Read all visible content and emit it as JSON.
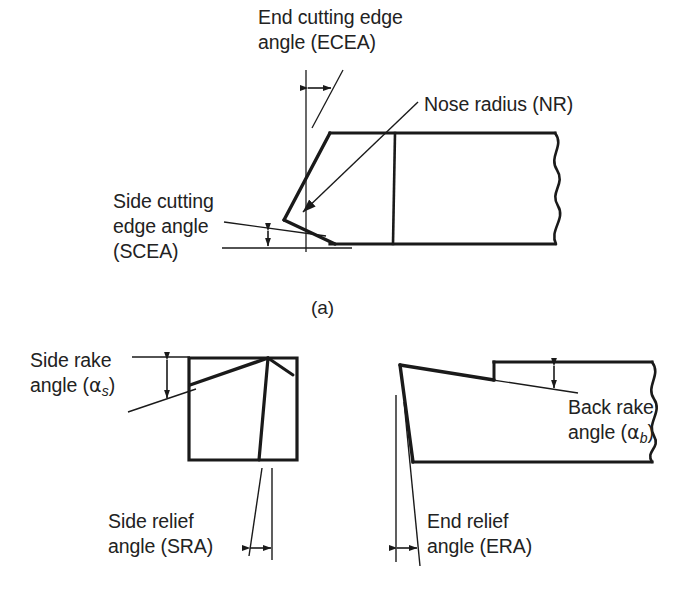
{
  "figure": {
    "background_color": "#ffffff",
    "line_color": "#1a1a1a",
    "text_color": "#222222",
    "width": 676,
    "height": 614
  },
  "view_a": {
    "caption": "(a)",
    "labels": {
      "ecea_line1": "End cutting edge",
      "ecea_line2": "angle (ECEA)",
      "nose_radius": "Nose radius (NR)",
      "scea_line1": "Side cutting",
      "scea_line2": "edge angle",
      "scea_line3": "(SCEA)"
    },
    "annotations": [
      {
        "name": "end-cutting-edge-angle",
        "abbr": "ECEA",
        "indicator": "horizontal-double-arrow"
      },
      {
        "name": "nose-radius",
        "abbr": "NR",
        "indicator": "leader-arrow"
      },
      {
        "name": "side-cutting-edge-angle",
        "abbr": "SCEA",
        "indicator": "vertical-double-arrow"
      }
    ]
  },
  "view_b_left": {
    "labels": {
      "side_rake_line1": "Side rake",
      "side_rake_line2_pre": "angle (",
      "side_rake_symbol": "α",
      "side_rake_subscript": "s",
      "side_rake_line2_post": ")",
      "side_relief_line1": "Side relief",
      "side_relief_line2": "angle (SRA)"
    },
    "annotations": [
      {
        "name": "side-rake-angle",
        "abbr": "αs",
        "indicator": "vertical-double-arrow"
      },
      {
        "name": "side-relief-angle",
        "abbr": "SRA",
        "indicator": "horizontal-double-arrow"
      }
    ]
  },
  "view_b_right": {
    "labels": {
      "back_rake_line1": "Back rake",
      "back_rake_line2_pre": "angle (",
      "back_rake_symbol": "α",
      "back_rake_subscript": "b",
      "back_rake_line2_post": ")",
      "end_relief_line1": "End relief",
      "end_relief_line2": "angle (ERA)"
    },
    "annotations": [
      {
        "name": "back-rake-angle",
        "abbr": "αb",
        "indicator": "vertical-double-arrow"
      },
      {
        "name": "end-relief-angle",
        "abbr": "ERA",
        "indicator": "horizontal-double-arrow"
      }
    ]
  }
}
